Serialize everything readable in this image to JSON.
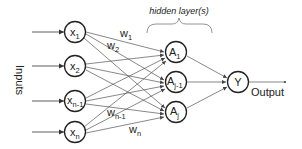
{
  "diagram": {
    "title_annotation": "hidden layer(s)",
    "inputs_label": "Inputs",
    "output_label": "Output",
    "input_nodes": [
      {
        "base": "x",
        "sub": "1"
      },
      {
        "base": "x",
        "sub": "2"
      },
      {
        "base": "x",
        "sub": "n-1"
      },
      {
        "base": "x",
        "sub": "n"
      }
    ],
    "hidden_nodes": [
      {
        "base": "A",
        "sub": "1"
      },
      {
        "base": "A",
        "sub": "j-1"
      },
      {
        "base": "A",
        "sub": "j"
      }
    ],
    "output_node": {
      "base": "Y",
      "sub": ""
    },
    "weights": [
      {
        "base": "w",
        "sub": "1"
      },
      {
        "base": "w",
        "sub": "2"
      },
      {
        "base": "w",
        "sub": "n-1"
      },
      {
        "base": "w",
        "sub": "n"
      }
    ],
    "colors": {
      "stroke": "#222222",
      "edge": "#555555",
      "brace": "#888888"
    }
  }
}
